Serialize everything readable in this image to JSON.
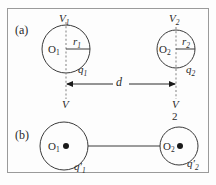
{
  "figure": {
    "background_color": "#fdfdfd",
    "frame_color": "#9a9a9a",
    "ink_color": "#3a3a3a",
    "dashed_color": "#8c8c8c"
  },
  "panels": {
    "a": {
      "tag": "(a)",
      "left_sphere": {
        "center_label": "O",
        "center_sub": "1",
        "potential_label": "V",
        "potential_sub": "1",
        "radius_label": "r",
        "radius_sub": "1",
        "charge_label": "q",
        "charge_sub": "1",
        "axis_label": "V",
        "axis_sub": ""
      },
      "right_sphere": {
        "center_label": "O",
        "center_sub": "2",
        "potential_label": "V",
        "potential_sub": "2",
        "radius_label": "r",
        "radius_sub": "2",
        "charge_label": "q",
        "charge_sub": "2",
        "axis_label": "V",
        "axis_sub": "2"
      },
      "separation": {
        "label": "d",
        "sub": ""
      }
    },
    "b": {
      "tag": "(b)",
      "left_sphere": {
        "center_label": "O",
        "center_sub": "1",
        "charge_label": "q",
        "charge_prime": "′",
        "charge_sub": "1"
      },
      "right_sphere": {
        "center_label": "O",
        "center_sub": "2",
        "charge_label": "q",
        "charge_prime": "′",
        "charge_sub": "2"
      },
      "connector": "wire"
    }
  }
}
